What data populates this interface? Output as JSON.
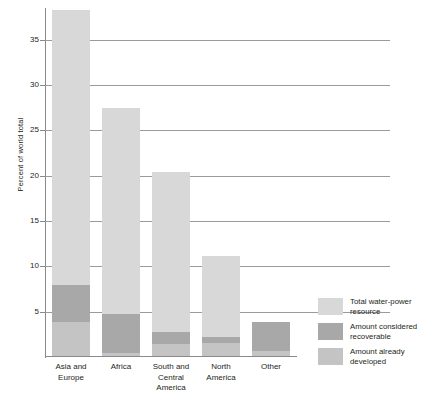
{
  "chart_data": {
    "type": "bar",
    "subtype": "stacked-bar",
    "title": "",
    "xlabel": "",
    "ylabel": "Percent of world total",
    "ylim": [
      0,
      38.5
    ],
    "yticks": [
      5,
      10,
      15,
      20,
      25,
      30,
      35
    ],
    "grid": true,
    "legend_position": "right-bottom",
    "categories": [
      "Asia and Europe",
      "Africa",
      "South and Central America",
      "North America",
      "Other"
    ],
    "series": [
      {
        "name": "Total water-power resource",
        "color": "#d8d8d8",
        "values": [
          38.2,
          27.4,
          20.3,
          11.0,
          3.8
        ]
      },
      {
        "name": "Amount considered recoverable",
        "color": "#a8a8a8",
        "values": [
          7.8,
          4.6,
          2.6,
          2.1,
          3.8
        ]
      },
      {
        "name": "Amount already developed",
        "color": "#c4c4c4",
        "values": [
          3.7,
          0.3,
          1.3,
          1.4,
          0.6
        ]
      }
    ]
  },
  "axis": {
    "y_title": "Percent of world total",
    "tick_labels": [
      "35",
      "30",
      "25",
      "20",
      "15",
      "10",
      "5"
    ]
  },
  "categories": [
    {
      "line1": "Asia and",
      "line2": "Europe",
      "line3": ""
    },
    {
      "line1": "Africa",
      "line2": "",
      "line3": ""
    },
    {
      "line1": "South and",
      "line2": "Central",
      "line3": "America"
    },
    {
      "line1": "North",
      "line2": "America",
      "line3": ""
    },
    {
      "line1": "Other",
      "line2": "",
      "line3": ""
    }
  ],
  "legend": {
    "items": [
      {
        "label": "Total water-power resource",
        "color": "#d8d8d8"
      },
      {
        "label": "Amount considered recoverable",
        "color": "#a8a8a8"
      },
      {
        "label": "Amount already developed",
        "color": "#c4c4c4"
      }
    ]
  },
  "colors": {
    "total": "#d8d8d8",
    "recoverable": "#a8a8a8",
    "developed": "#c4c4c4",
    "axis": "#8a8a8a",
    "grid": "#9a9a9a",
    "text": "#231f20"
  }
}
